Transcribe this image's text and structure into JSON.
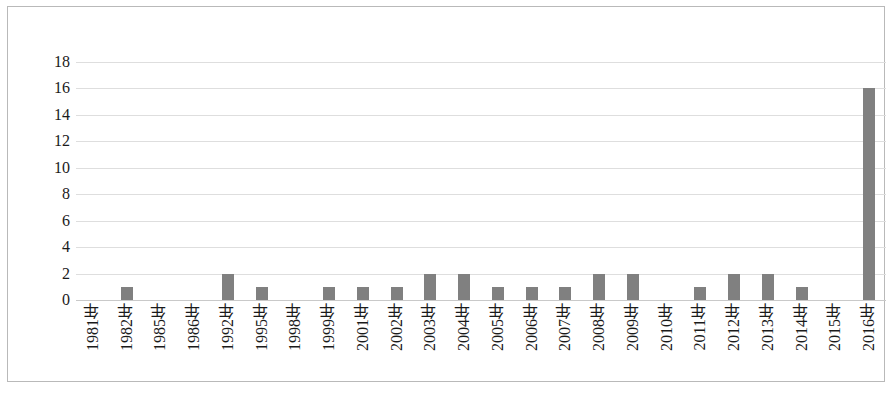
{
  "chart_data": {
    "type": "bar",
    "title": "",
    "subtitle": "",
    "xlabel": "",
    "ylabel": "",
    "categories": [
      "1981年",
      "1982年",
      "1985年",
      "1986年",
      "1992年",
      "1995年",
      "1998年",
      "1999年",
      "2001年",
      "2002年",
      "2003年",
      "2004年",
      "2005年",
      "2006年",
      "2007年",
      "2008年",
      "2009年",
      "2010年",
      "2011年",
      "2012年",
      "2013年",
      "2014年",
      "2015年",
      "2016年"
    ],
    "values": [
      0,
      1,
      0,
      0,
      2,
      1,
      0,
      1,
      1,
      1,
      2,
      2,
      1,
      1,
      1,
      2,
      2,
      0,
      1,
      2,
      2,
      1,
      0,
      16
    ],
    "ylim": [
      0,
      18
    ],
    "ytick_labels": [
      "18",
      "16",
      "14",
      "12",
      "10",
      "8",
      "6",
      "4",
      "2",
      "0"
    ],
    "ytick_values": [
      18,
      16,
      14,
      12,
      10,
      8,
      6,
      4,
      2,
      0
    ],
    "ytick_step": 2,
    "grid": "horizontal",
    "legend": "none",
    "bar_color": "#808080",
    "gridline_color": "#dedede",
    "background_color": "#ffffff",
    "border_color": "#b9b9b9"
  }
}
